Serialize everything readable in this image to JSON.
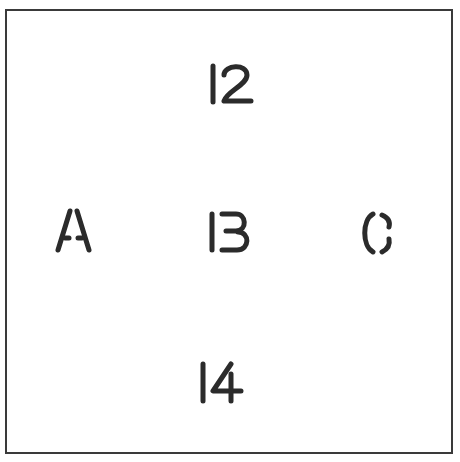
{
  "figure": {
    "top": "12",
    "center": "13",
    "center_alt_reading": "B",
    "left": "A",
    "right": "C",
    "bottom": "14"
  },
  "colors": {
    "ink": "#2b2b2b",
    "border": "#3a3a3a",
    "background": "#ffffff"
  }
}
